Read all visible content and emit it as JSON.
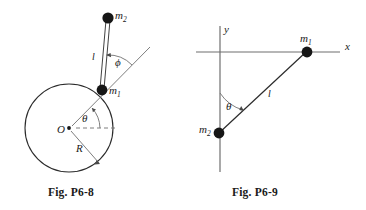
{
  "page": {
    "background_color": "#ffffff",
    "ink_color": "#2b2b2b",
    "width": 366,
    "height": 210
  },
  "figures": [
    {
      "id": "fig-p6-8",
      "caption": "Fig.  P6-8",
      "description": "Pendulum of length l with bob m2 attached at point m1 on the rim of a circle of radius R centered at O; angle theta from horizontal reference at O, angle phi between rod and radial line.",
      "labels": {
        "mass_upper": "m",
        "mass_upper_sub": "2",
        "mass_lower": "m",
        "mass_lower_sub": "1",
        "rod_length": "l",
        "angle_theta": "θ",
        "angle_phi": "ϕ",
        "center": "O",
        "radius": "R"
      },
      "geometry": {
        "circle_center": [
          69,
          128
        ],
        "circle_radius": 44,
        "m1_point": [
          102,
          90
        ],
        "m2_point": [
          108,
          18
        ],
        "theta_degrees": 49,
        "phi_degrees": 41
      }
    },
    {
      "id": "fig-p6-9",
      "caption": "Fig.  P6-9",
      "description": "Cartesian axes x and y; mass m1 on positive x-axis, mass m2 on negative y-axis, connected by a rod of length l making angle theta with the y-axis.",
      "labels": {
        "axis_x": "x",
        "axis_y": "y",
        "mass_right": "m",
        "mass_right_sub": "1",
        "mass_lower": "m",
        "mass_lower_sub": "2",
        "rod_length": "l",
        "angle_theta": "θ"
      },
      "geometry": {
        "origin": [
          220,
          52
        ],
        "m1_point": [
          307,
          52
        ],
        "m2_point": [
          219,
          133
        ],
        "theta_degrees": 47
      }
    }
  ]
}
